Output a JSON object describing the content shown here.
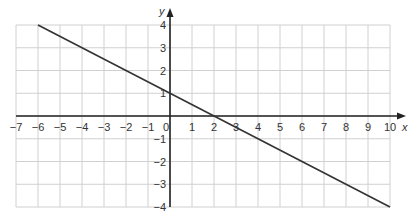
{
  "chart_data": {
    "type": "line",
    "title": "",
    "xlabel": "x",
    "ylabel": "y",
    "xlim": [
      -7,
      10
    ],
    "ylim": [
      -4,
      4
    ],
    "grid": true,
    "x_ticks": [
      -7,
      -6,
      -5,
      -4,
      -3,
      -2,
      -1,
      0,
      1,
      2,
      3,
      4,
      5,
      6,
      7,
      8,
      9,
      10
    ],
    "y_ticks": [
      -4,
      -3,
      -2,
      -1,
      1,
      2,
      3,
      4
    ],
    "x_tick_labels": [
      "−7",
      "−6",
      "−5",
      "−4",
      "−3",
      "−2",
      "−1",
      "0",
      "1",
      "2",
      "3",
      "4",
      "5",
      "6",
      "7",
      "8",
      "9",
      "10"
    ],
    "y_tick_labels": {
      "4": "4",
      "3": "3",
      "2": "2",
      "1": "1",
      "-1": "−1",
      "-2": "−2",
      "-3": "−3",
      "-4": "−4"
    },
    "series": [
      {
        "name": "line",
        "equation": "y = -0.5x + 1",
        "x": [
          -6,
          10
        ],
        "y": [
          4,
          -4
        ]
      }
    ],
    "annotations": [
      {
        "label": "y-intercept",
        "x": 0,
        "y": 1
      },
      {
        "label": "x-intercept",
        "x": 2,
        "y": 0
      }
    ]
  },
  "colors": {
    "grid": "#d0d0d0",
    "axis": "#222222",
    "line": "#333333",
    "text": "#333333"
  },
  "layout": {
    "x0_px": 170,
    "x_unit_px": 22,
    "y0_px": 116,
    "y_unit_px": 22.75
  }
}
